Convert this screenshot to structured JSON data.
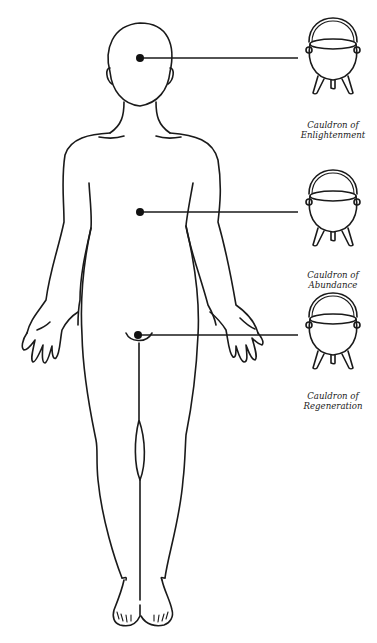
{
  "diagram": {
    "colors": {
      "line": "#1a1a1a",
      "background": "#ffffff"
    },
    "cauldrons": [
      {
        "id": "head",
        "label_line1": "Cauldron of",
        "label_line2": "Enlightenment",
        "point": [
          140,
          58
        ],
        "icon": [
          333,
          58
        ],
        "label_pos": [
          288,
          121
        ]
      },
      {
        "id": "chest",
        "label_line1": "Cauldron of",
        "label_line2": "Abundance",
        "point": [
          140,
          212
        ],
        "icon": [
          333,
          210
        ],
        "label_pos": [
          288,
          271
        ]
      },
      {
        "id": "belly",
        "label_line1": "Cauldron of",
        "label_line2": "Regeneration",
        "point": [
          138,
          335
        ],
        "icon": [
          333,
          333
        ],
        "label_pos": [
          288,
          392
        ]
      }
    ]
  }
}
